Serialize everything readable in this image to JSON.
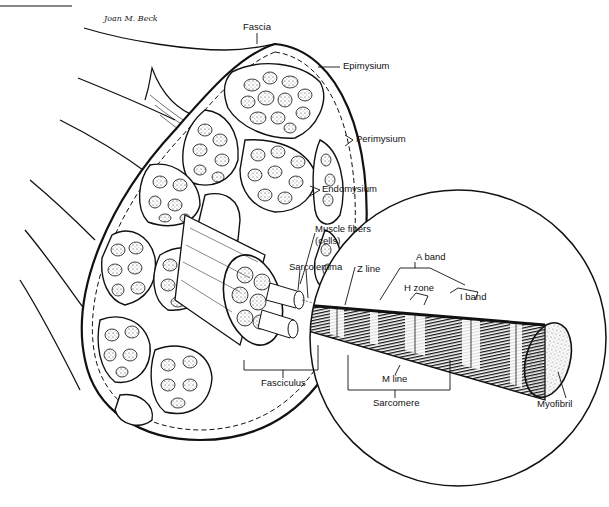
{
  "diagram": {
    "signature": "Joan M. Beck",
    "labels": {
      "fascia": "Fascia",
      "epimysium": "Epimysium",
      "perimysium": "Perimysium",
      "endomysium": "Endomysium",
      "muscle_fibers": "Muscle fibers",
      "muscle_fibers_sub": "(cells)",
      "sarcolemma": "Sarcolemma",
      "fasciculus": "Fasciculus",
      "z_line": "Z line",
      "a_band": "A band",
      "h_zone": "H zone",
      "i_band": "I band",
      "m_line": "M line",
      "sarcomere": "Sarcomere",
      "myofibril": "Myofibril"
    },
    "colors": {
      "ink": "#111111",
      "background": "#ffffff",
      "fiber_fill": "#f4f4f4"
    }
  }
}
